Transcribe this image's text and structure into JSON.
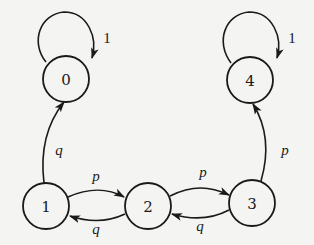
{
  "diagram": {
    "type": "state-transition",
    "nodes": [
      {
        "id": "0",
        "label": "0"
      },
      {
        "id": "1",
        "label": "1"
      },
      {
        "id": "2",
        "label": "2"
      },
      {
        "id": "3",
        "label": "3"
      },
      {
        "id": "4",
        "label": "4"
      }
    ],
    "edges": [
      {
        "from": "0",
        "to": "0",
        "label": "1"
      },
      {
        "from": "4",
        "to": "4",
        "label": "1"
      },
      {
        "from": "1",
        "to": "0",
        "label": "q"
      },
      {
        "from": "1",
        "to": "2",
        "label": "p"
      },
      {
        "from": "2",
        "to": "1",
        "label": "q"
      },
      {
        "from": "2",
        "to": "3",
        "label": "p"
      },
      {
        "from": "3",
        "to": "2",
        "label": "q"
      },
      {
        "from": "3",
        "to": "4",
        "label": "p"
      }
    ]
  }
}
